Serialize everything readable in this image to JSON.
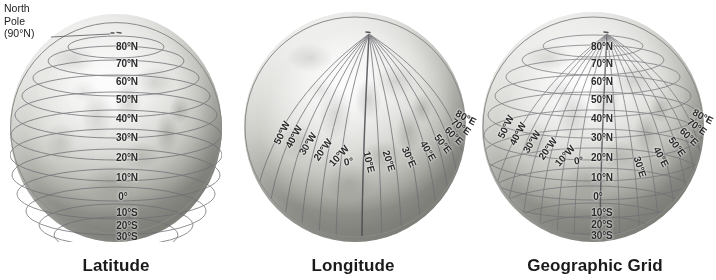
{
  "figure": {
    "background_color": "#ffffff",
    "globe_count": 3
  },
  "callout": {
    "line1": "North",
    "line2": "Pole",
    "line3": "(90°N)",
    "target": "north-pole"
  },
  "panels": [
    {
      "id": "latitude",
      "caption": "Latitude",
      "shows": "parallels"
    },
    {
      "id": "longitude",
      "caption": "Longitude",
      "shows": "meridians"
    },
    {
      "id": "grid",
      "caption": "Geographic Grid",
      "shows": "parallels-and-meridians"
    }
  ],
  "latitude_labels": [
    {
      "text": "80°N",
      "value": 80
    },
    {
      "text": "70°N",
      "value": 70
    },
    {
      "text": "60°N",
      "value": 60
    },
    {
      "text": "50°N",
      "value": 50
    },
    {
      "text": "40°N",
      "value": 40
    },
    {
      "text": "30°N",
      "value": 30
    },
    {
      "text": "20°N",
      "value": 20
    },
    {
      "text": "10°N",
      "value": 10
    },
    {
      "text": "0°",
      "value": 0
    },
    {
      "text": "10°S",
      "value": -10
    },
    {
      "text": "20°S",
      "value": -20
    },
    {
      "text": "30°S",
      "value": -30
    }
  ],
  "longitude_labels": [
    {
      "text": "50°W",
      "value": -50
    },
    {
      "text": "40°W",
      "value": -40
    },
    {
      "text": "30°W",
      "value": -30
    },
    {
      "text": "20°W",
      "value": -20
    },
    {
      "text": "10°W",
      "value": -10
    },
    {
      "text": "0°",
      "value": 0
    },
    {
      "text": "10°E",
      "value": 10
    },
    {
      "text": "20°E",
      "value": 20
    },
    {
      "text": "30°E",
      "value": 30
    },
    {
      "text": "40°E",
      "value": 40
    },
    {
      "text": "50°E",
      "value": 50
    },
    {
      "text": "60°E",
      "value": 60
    },
    {
      "text": "70°E",
      "value": 70
    },
    {
      "text": "80°E",
      "value": 80
    }
  ],
  "colors": {
    "grid_line": "#6e6e74",
    "prime_meridian": "#4a4a50",
    "label_text": "#2b2b2b",
    "caption_text": "#1a1a1a",
    "globe_light": "#fdfdfd",
    "globe_shadow": "#9b9b95"
  }
}
